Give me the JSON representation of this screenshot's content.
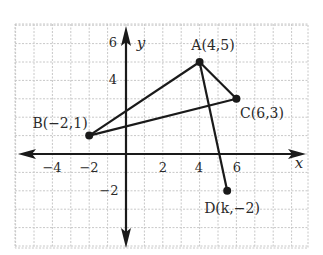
{
  "diagram": {
    "type": "coordinate-plane",
    "grid": {
      "unit_px": 18.4,
      "color": "#c8c8c8",
      "x_range": [
        -6,
        10
      ],
      "y_range": [
        -5,
        7
      ]
    },
    "axes": {
      "x_label": "x",
      "y_label": "y",
      "x_ticks": [
        {
          "value": -4,
          "label": "−4"
        },
        {
          "value": -2,
          "label": "−2"
        },
        {
          "value": 2,
          "label": "2"
        },
        {
          "value": 4,
          "label": "4"
        },
        {
          "value": 6,
          "label": "6"
        }
      ],
      "y_ticks": [
        {
          "value": 6,
          "label": "6"
        },
        {
          "value": 4,
          "label": "4"
        },
        {
          "value": -2,
          "label": "−2"
        }
      ]
    },
    "points": [
      {
        "name": "A",
        "label": "A(4,5)",
        "x": 4,
        "y": 5
      },
      {
        "name": "B",
        "label": "B(−2,1)",
        "x": -2,
        "y": 1
      },
      {
        "name": "C",
        "label": "C(6,3)",
        "x": 6,
        "y": 3
      },
      {
        "name": "D",
        "label": "D(k,−2)",
        "x": 5.5,
        "y": -2
      }
    ],
    "segments": [
      [
        "A",
        "B"
      ],
      [
        "A",
        "C"
      ],
      [
        "B",
        "C"
      ],
      [
        "A",
        "D"
      ]
    ],
    "colors": {
      "line": "#1a1a1a",
      "text": "#2a2a2a",
      "grid": "#c8c8c8"
    }
  }
}
